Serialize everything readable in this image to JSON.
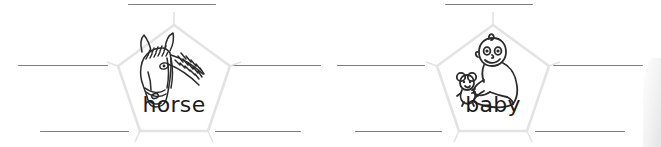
{
  "worksheet": {
    "title": "Word web worksheet",
    "background_color": "#ffffff",
    "line_color": "#7d7d80",
    "pentagon_stroke_color": "#e3e3e4",
    "pentagon_fill_color": "#ffffff",
    "word_color": "#1b1b1b",
    "clusters": [
      {
        "id": "horse",
        "word": "horse",
        "picture_name": "horse-head-illustration",
        "blank_count": 5,
        "blanks": [
          {
            "position": "top",
            "label": ""
          },
          {
            "position": "left",
            "label": ""
          },
          {
            "position": "right",
            "label": ""
          },
          {
            "position": "bottom-left",
            "label": ""
          },
          {
            "position": "bottom-right",
            "label": ""
          }
        ]
      },
      {
        "id": "baby",
        "word": "baby",
        "picture_name": "baby-with-teddy-illustration",
        "blank_count": 5,
        "blanks": [
          {
            "position": "top",
            "label": ""
          },
          {
            "position": "left",
            "label": ""
          },
          {
            "position": "right",
            "label": ""
          },
          {
            "position": "bottom-left",
            "label": ""
          },
          {
            "position": "bottom-right",
            "label": ""
          }
        ]
      }
    ]
  }
}
